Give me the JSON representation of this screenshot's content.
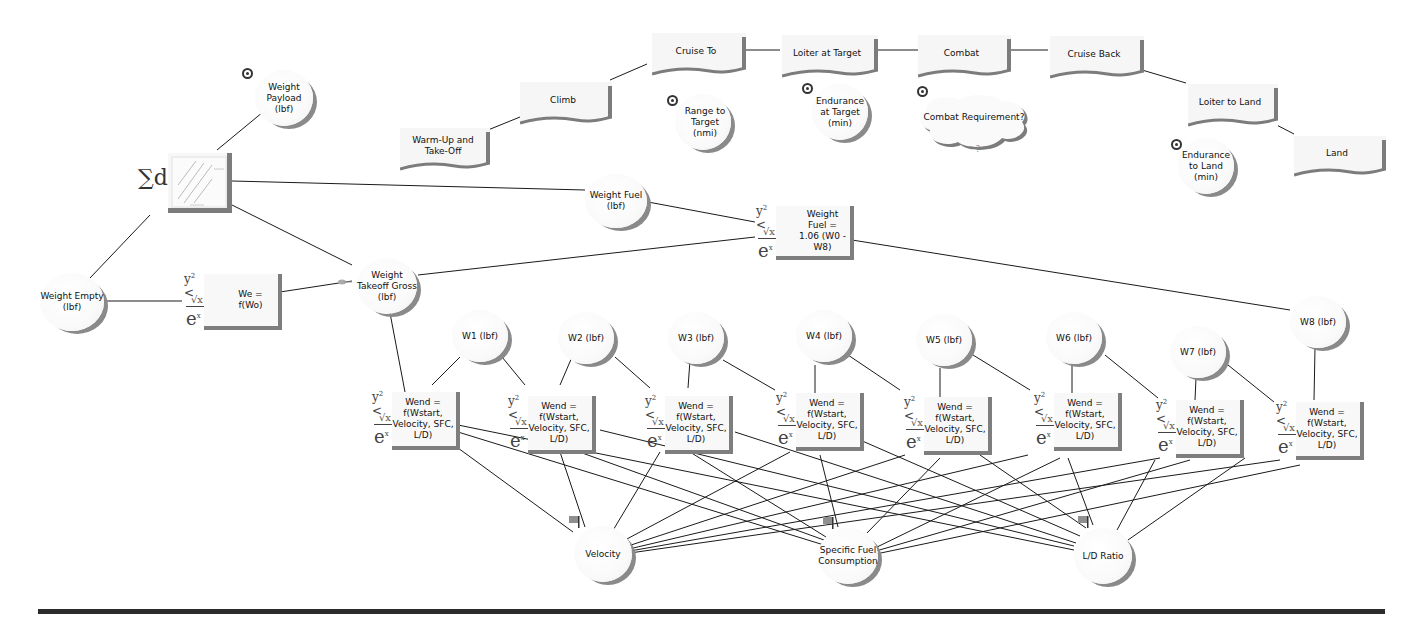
{
  "diagram": {
    "type": "influence-diagram",
    "colors": {
      "shadow": "#7c7c7c",
      "node_fill": "#f7f7f7",
      "line": "#1a1a1a",
      "rule": "#2c2c2c"
    }
  },
  "mission_phases": [
    {
      "id": "warmup",
      "label": "Warm-Up and Take-Off"
    },
    {
      "id": "climb",
      "label": "Climb"
    },
    {
      "id": "cruise_to",
      "label": "Cruise To"
    },
    {
      "id": "loiter_target",
      "label": "Loiter at Target"
    },
    {
      "id": "combat",
      "label": "Combat"
    },
    {
      "id": "cruise_back",
      "label": "Cruise Back"
    },
    {
      "id": "loiter_land",
      "label": "Loiter to Land"
    },
    {
      "id": "land",
      "label": "Land"
    }
  ],
  "requirements": [
    {
      "id": "range",
      "label": "Range to Target (nmi)",
      "icon": "bullseye-icon"
    },
    {
      "id": "endurance_target",
      "label": "Endurance at Target (min)",
      "icon": "bullseye-icon"
    },
    {
      "id": "combat_req",
      "label": "Combat Requirement?",
      "icon": "bullseye-icon"
    },
    {
      "id": "endurance_land",
      "label": "Endurance to Land (min)",
      "icon": "bullseye-icon"
    }
  ],
  "variables": {
    "payload": {
      "label": "Weight Payload (lbf)",
      "icon": "bullseye-icon"
    },
    "empty": {
      "label": "Weight Empty (lbf)"
    },
    "takeoff": {
      "label": "Weight Takeoff Gross (lbf)"
    },
    "fuel": {
      "label": "Weight Fuel (lbf)"
    },
    "velocity": {
      "label": "Velocity",
      "icon": "flag-icon"
    },
    "sfc": {
      "label": "Specific Fuel Consumption",
      "icon": "flag-icon"
    },
    "ld": {
      "label": "L/D Ratio",
      "icon": "flag-icon"
    }
  },
  "segment_weights": [
    {
      "id": "w1",
      "label": "W1 (lbf)"
    },
    {
      "id": "w2",
      "label": "W2 (lbf)"
    },
    {
      "id": "w3",
      "label": "W3 (lbf)"
    },
    {
      "id": "w4",
      "label": "W4 (lbf)"
    },
    {
      "id": "w5",
      "label": "W5 (lbf)"
    },
    {
      "id": "w6",
      "label": "W6 (lbf)"
    },
    {
      "id": "w7",
      "label": "W7 (lbf)"
    },
    {
      "id": "w8",
      "label": "W8 (lbf)"
    }
  ],
  "equations": {
    "we": {
      "label": "We = f(Wo)"
    },
    "fuel": {
      "label": "Weight Fuel = 1.06 (W0 - W8)"
    },
    "wend": {
      "label": "Wend = f(Wstart, Velocity, SFC, L/D)",
      "count": 8
    }
  },
  "sum_node": {
    "symbol": "∑d",
    "label": ""
  }
}
